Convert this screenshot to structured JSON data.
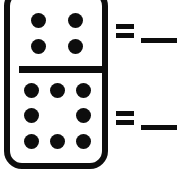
{
  "worksheet": {
    "type": "domino-addition-exercise",
    "background_color": "#ffffff",
    "ink_color": "#0d0d0d"
  },
  "domino": {
    "name": "domino-tile",
    "border_color": "#0d0d0d",
    "face_color": "#ffffff",
    "top_half": {
      "label": "top-face",
      "pip_count": 4,
      "arrangement": "2x2",
      "rows": [
        [
          1,
          1
        ],
        [
          1,
          1
        ]
      ]
    },
    "divider": {
      "label": "divider-bar"
    },
    "bottom_half": {
      "label": "bottom-face",
      "pip_count": 8,
      "arrangement": "3x3-minus-center",
      "rows": [
        [
          1,
          1,
          1
        ],
        [
          1,
          0,
          1
        ],
        [
          1,
          1,
          1
        ]
      ]
    }
  },
  "equations": [
    {
      "id": "equation-top",
      "operator": "=",
      "answer_value": "",
      "answer_placeholder": "____"
    },
    {
      "id": "equation-bottom",
      "operator": "=",
      "answer_value": "",
      "answer_placeholder": "____"
    }
  ]
}
